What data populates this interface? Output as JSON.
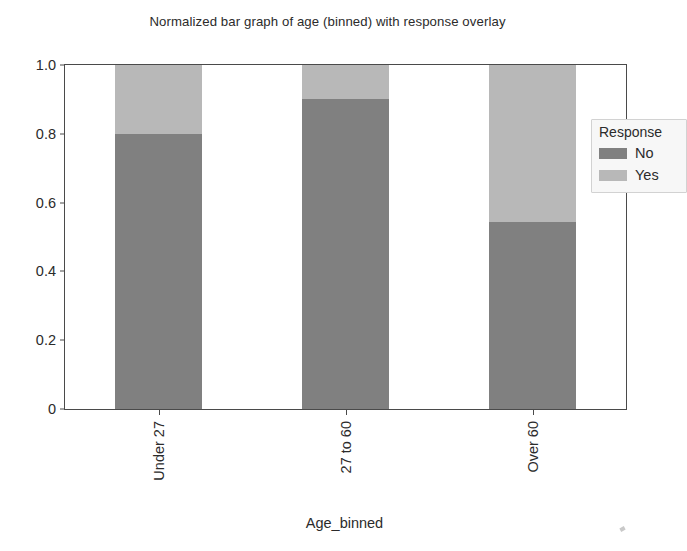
{
  "chart_data": {
    "type": "bar",
    "subtype": "stacked-normalized",
    "title": "Normalized bar graph of age (binned) with response overlay",
    "xlabel": "Age_binned",
    "ylabel": "",
    "categories": [
      "Under 27",
      "27 to 60",
      "Over 60"
    ],
    "series": [
      {
        "name": "No",
        "values": [
          0.8,
          0.9,
          0.545
        ],
        "color": "#808080"
      },
      {
        "name": "Yes",
        "values": [
          0.2,
          0.1,
          0.455
        ],
        "color": "#b8b8b8"
      }
    ],
    "ylim": [
      0,
      1.0
    ],
    "yticks": [
      0,
      0.2,
      0.4,
      0.6,
      0.8,
      1.0
    ],
    "ytick_labels": [
      "0",
      "0.2",
      "0.4",
      "0.6",
      "0.8",
      "1.0"
    ],
    "grid": false,
    "legend": {
      "title": "Response",
      "position": "upper right",
      "entries": [
        {
          "label": "No",
          "color": "#808080"
        },
        {
          "label": "Yes",
          "color": "#b8b8b8"
        }
      ]
    },
    "xtick_label_rotation": 90,
    "bar_stack_total": 1.0
  }
}
